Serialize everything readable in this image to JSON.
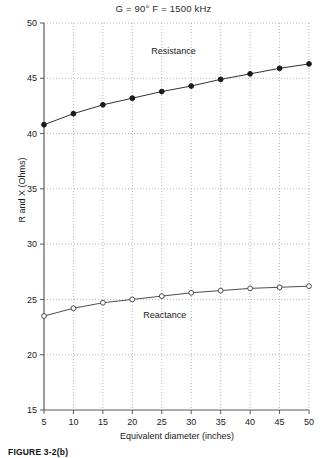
{
  "figure": {
    "caption": "FIGURE 3-2(b)"
  },
  "chart_data": {
    "type": "line",
    "title": "G = 90°   F = 1500 kHz",
    "xlabel": "Equivalent diameter (inches)",
    "ylabel": "R and X (Ohms)",
    "xlim": [
      5,
      50
    ],
    "ylim": [
      15,
      50
    ],
    "xticks": [
      5,
      10,
      15,
      20,
      25,
      30,
      35,
      40,
      45,
      50
    ],
    "yticks": [
      15,
      20,
      25,
      30,
      35,
      40,
      45,
      50
    ],
    "grid": true,
    "legend": "inline-annotations",
    "x": [
      5,
      10,
      15,
      20,
      25,
      30,
      35,
      40,
      45,
      50
    ],
    "series": [
      {
        "name": "Resistance",
        "marker": "filled-circle",
        "color": "#1a1a1a",
        "label_x": 27,
        "label_y": 47.2,
        "values": [
          40.8,
          41.8,
          42.6,
          43.2,
          43.8,
          44.3,
          44.9,
          45.4,
          45.9,
          46.3
        ]
      },
      {
        "name": "Reactance",
        "marker": "open-circle",
        "color": "#3a3a3a",
        "label_x": 25.5,
        "label_y": 23.3,
        "values": [
          23.5,
          24.2,
          24.7,
          25.0,
          25.3,
          25.6,
          25.8,
          26.0,
          26.1,
          26.2
        ]
      }
    ]
  }
}
